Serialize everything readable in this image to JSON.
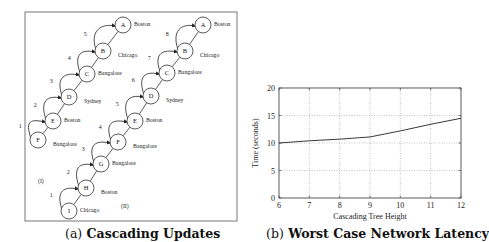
{
  "figure_a": {
    "caption_label": "(a)",
    "caption_text": "Cascading Updates",
    "chains": [
      {
        "label": "(I)",
        "nodes": [
          {
            "id": "A",
            "city": "Boston"
          },
          {
            "id": "B",
            "city": "Chicago"
          },
          {
            "id": "C",
            "city": "Bangalore"
          },
          {
            "id": "D",
            "city": "Sydney"
          },
          {
            "id": "E",
            "city": "Boston"
          },
          {
            "id": "F",
            "city": "Bangalore"
          }
        ],
        "edges": [
          "5",
          "4",
          "3",
          "2",
          "1"
        ]
      },
      {
        "label": "(II)",
        "nodes": [
          {
            "id": "A",
            "city": "Boston"
          },
          {
            "id": "B",
            "city": "Chicago"
          },
          {
            "id": "C",
            "city": "Bangalore"
          },
          {
            "id": "D",
            "city": "Sydney"
          },
          {
            "id": "E",
            "city": "Boston"
          },
          {
            "id": "F",
            "city": "Bangalore"
          },
          {
            "id": "G",
            "city": "Bangalore"
          },
          {
            "id": "H",
            "city": "Boston"
          },
          {
            "id": "I",
            "city": "Chicago"
          }
        ],
        "edges": [
          "8",
          "7",
          "6",
          "5",
          "4",
          "3",
          "2",
          "1"
        ]
      }
    ]
  },
  "figure_b": {
    "caption_label": "(b)",
    "caption_text": "Worst Case Network Latency"
  },
  "chart_data": {
    "type": "line",
    "title": "",
    "xlabel": "Cascading Tree Height",
    "ylabel": "Time (seconds)",
    "x": [
      6,
      7,
      8,
      9,
      10,
      11,
      12
    ],
    "series": [
      {
        "name": "Worst case latency",
        "values": [
          10.0,
          10.4,
          10.7,
          11.1,
          12.2,
          13.4,
          14.5
        ]
      }
    ],
    "xlim": [
      6,
      12
    ],
    "ylim": [
      0,
      20
    ],
    "xticks": [
      "6",
      "7",
      "8",
      "9",
      "10",
      "11",
      "12"
    ],
    "yticks": [
      "0",
      "5",
      "10",
      "15",
      "20"
    ],
    "grid": true,
    "legend": "none"
  }
}
